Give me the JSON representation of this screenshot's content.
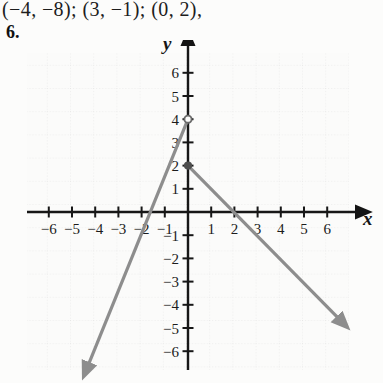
{
  "answer_line": {
    "text": "(−4, −8); (3, −1); (0, 2),"
  },
  "problem": {
    "number": "6."
  },
  "axis_labels": {
    "x": "x",
    "y": "y"
  },
  "chart_data": {
    "type": "line",
    "title": "",
    "xlabel": "x",
    "ylabel": "y",
    "xlim": [
      -7.2,
      7.0
    ],
    "ylim": [
      -6.9,
      6.7
    ],
    "grid": true,
    "grid_spacing": 1,
    "legend": "none",
    "x_ticks": [
      -6,
      -5,
      -4,
      -3,
      -2,
      -1,
      1,
      2,
      3,
      4,
      5,
      6
    ],
    "y_ticks": [
      6,
      5,
      4,
      3,
      2,
      1,
      -1,
      -2,
      -3,
      -4,
      -5,
      -6
    ],
    "x_tick_labels": [
      "−6",
      "−5",
      "−4",
      "−3",
      "−2",
      "−1",
      "1",
      "2",
      "3",
      "4",
      "5",
      "6"
    ],
    "y_tick_labels": [
      "6",
      "5",
      "4",
      "3",
      "2",
      "1",
      "−1",
      "−2",
      "−3",
      "−4",
      "−5",
      "−6"
    ],
    "series": [
      {
        "name": "ray-up-left",
        "kind": "ray",
        "color": "#8d8d8d",
        "from": [
          0,
          4
        ],
        "to": [
          -4.3,
          -6.6
        ],
        "arrow_at": "to"
      },
      {
        "name": "ray-down-right",
        "kind": "ray",
        "color": "#8d8d8d",
        "from": [
          0,
          2
        ],
        "to": [
          6.5,
          -4.6
        ],
        "arrow_at": "to"
      }
    ],
    "points": [
      {
        "name": "vertex-open-point",
        "x": 0,
        "y": 4,
        "style": "open"
      },
      {
        "name": "filled-point",
        "x": 0,
        "y": 2,
        "style": "filled"
      }
    ]
  }
}
